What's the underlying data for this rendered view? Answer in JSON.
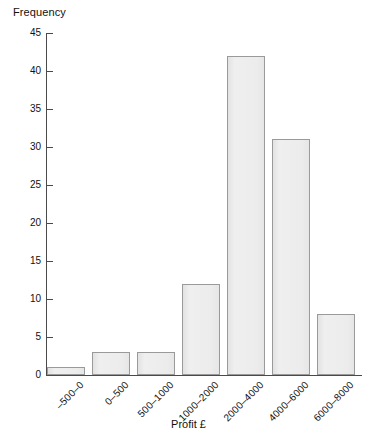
{
  "chart_data": {
    "type": "bar",
    "title": "",
    "xlabel": "Profit £",
    "ylabel": "Frequency",
    "categories": [
      "–500–0",
      "0–500",
      "500–1000",
      "1000–2000",
      "2000–4000",
      "4000–6000",
      "6000–8000"
    ],
    "values": [
      1,
      3,
      3,
      12,
      42,
      31,
      8
    ],
    "ylim": [
      0,
      45
    ],
    "ytick_values": [
      0,
      5,
      10,
      15,
      20,
      25,
      30,
      35,
      40,
      45
    ],
    "ytick_labels": [
      "0",
      "5",
      "10",
      "15",
      "20",
      "25",
      "30",
      "35",
      "40",
      "45"
    ],
    "grid": false,
    "legend": null,
    "bar_fill_color": "#ebebeb",
    "bar_border_color": "#9a9a9a",
    "axis_color": "#4a4a4a"
  },
  "axes": {
    "y_title": "Frequency",
    "x_title": "Profit £"
  }
}
